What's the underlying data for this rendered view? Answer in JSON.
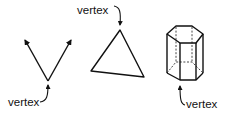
{
  "diagram": {
    "figures": [
      {
        "name": "angle",
        "label": "vertex"
      },
      {
        "name": "triangle",
        "label": "vertex"
      },
      {
        "name": "hexagonal-prism",
        "label": "vertex"
      }
    ]
  },
  "colors": {
    "background": "#ffffff",
    "stroke": "#111111"
  }
}
